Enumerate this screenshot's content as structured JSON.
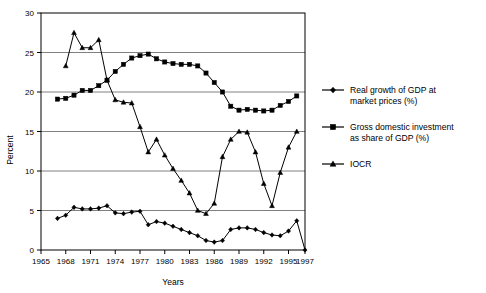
{
  "chart_data": {
    "type": "line",
    "title": "",
    "xlabel": "Years",
    "ylabel": "Percent",
    "xlim": [
      1965,
      1997
    ],
    "ylim": [
      0,
      30
    ],
    "ytick_labels": [
      "0",
      "5",
      "10",
      "15",
      "20",
      "25",
      "30"
    ],
    "ytick_values": [
      0,
      5,
      10,
      15,
      20,
      25,
      30
    ],
    "xtick_labels": [
      "1965",
      "1968",
      "1971",
      "1974",
      "1977",
      "1980",
      "1983",
      "1986",
      "1989",
      "1992",
      "1995",
      "1997"
    ],
    "xtick_values": [
      1965,
      1968,
      1971,
      1974,
      1977,
      1980,
      1983,
      1986,
      1989,
      1992,
      1995,
      1997
    ],
    "grid": "horizontal",
    "legend_position": "right",
    "series": [
      {
        "name": "Real growth of GDP at market prices (%)",
        "marker": "diamond",
        "x": [
          1967,
          1968,
          1969,
          1970,
          1971,
          1972,
          1973,
          1974,
          1975,
          1976,
          1977,
          1978,
          1979,
          1980,
          1981,
          1982,
          1983,
          1984,
          1985,
          1986,
          1987,
          1988,
          1989,
          1990,
          1991,
          1992,
          1993,
          1994,
          1995,
          1996,
          1997
        ],
        "values": [
          4.0,
          4.4,
          5.4,
          5.2,
          5.2,
          5.3,
          5.6,
          4.7,
          4.6,
          4.8,
          4.9,
          3.2,
          3.6,
          3.4,
          3.0,
          2.6,
          2.2,
          1.8,
          1.2,
          1.0,
          1.2,
          2.6,
          2.8,
          2.8,
          2.6,
          2.2,
          1.9,
          1.8,
          2.4,
          3.7,
          0.0
        ]
      },
      {
        "name": "Gross domestic investment as share of GDP (%)",
        "marker": "square",
        "x": [
          1967,
          1968,
          1969,
          1970,
          1971,
          1972,
          1973,
          1974,
          1975,
          1976,
          1977,
          1978,
          1979,
          1980,
          1981,
          1982,
          1983,
          1984,
          1985,
          1986,
          1987,
          1988,
          1989,
          1990,
          1991,
          1992,
          1993,
          1994,
          1995,
          1996
        ],
        "values": [
          19.1,
          19.2,
          19.6,
          20.2,
          20.2,
          20.8,
          21.5,
          22.6,
          23.5,
          24.3,
          24.6,
          24.8,
          24.2,
          23.8,
          23.6,
          23.5,
          23.5,
          23.3,
          22.4,
          21.2,
          20.0,
          18.2,
          17.7,
          17.8,
          17.7,
          17.6,
          17.7,
          18.3,
          18.8,
          19.5
        ]
      },
      {
        "name": "IOCR",
        "marker": "triangle",
        "x": [
          1968,
          1969,
          1970,
          1971,
          1972,
          1973,
          1974,
          1975,
          1976,
          1977,
          1978,
          1979,
          1980,
          1981,
          1982,
          1983,
          1984,
          1985,
          1986,
          1987,
          1988,
          1989,
          1990,
          1991,
          1992,
          1993,
          1994,
          1995,
          1996
        ],
        "values": [
          23.3,
          27.5,
          25.6,
          25.6,
          26.6,
          21.5,
          19.0,
          18.7,
          18.6,
          15.6,
          12.4,
          14.0,
          12.0,
          10.3,
          8.8,
          7.2,
          5.0,
          4.6,
          5.9,
          11.8,
          14.0,
          15.0,
          14.9,
          12.4,
          8.4,
          5.6,
          9.8,
          13.0,
          15.0
        ]
      }
    ]
  },
  "legend": {
    "items": [
      {
        "label": "Real growth of GDP at market prices (%)",
        "marker": "diamond"
      },
      {
        "label": "Gross domestic investment as share of GDP (%)",
        "marker": "square"
      },
      {
        "label": "IOCR",
        "marker": "triangle"
      }
    ]
  }
}
